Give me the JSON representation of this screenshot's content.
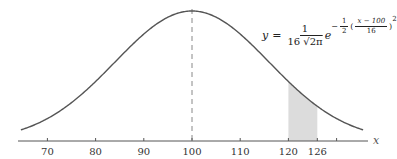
{
  "chart_data": {
    "type": "line",
    "title": "",
    "subtitle": "",
    "xlabel": "x",
    "ylabel": "",
    "distribution": "normal",
    "mean": 100,
    "std_dev": 16,
    "formula_text": "y = 1/(16√(2π)) e^(-1/2((x - 100)/16)^2)",
    "x_ticks": [
      70,
      80,
      90,
      100,
      110,
      120,
      126,
      130
    ],
    "x_tick_labels": [
      "70",
      "80",
      "90",
      "100",
      "110",
      "120",
      "126",
      ""
    ],
    "xlim": [
      64,
      136
    ],
    "grid": false,
    "legend": "none",
    "annotations": [
      {
        "type": "vertical-dashed-line",
        "x": 100,
        "label": "mean"
      },
      {
        "type": "shaded-region",
        "x_start": 120,
        "x_end": 126
      }
    ],
    "series": [
      {
        "name": "normal density",
        "x_range": [
          64.5,
          135.5
        ],
        "peak_x": 100
      }
    ]
  },
  "formula": {
    "y": "y",
    "equals": "=",
    "coef_num": "1",
    "coef_den": "16",
    "sqrt_content": "2π",
    "e": "e",
    "exp_sign": "−",
    "half_num": "1",
    "half_den": "2",
    "open": "(",
    "inner_num": "x − 100",
    "inner_den": "16",
    "close": ")",
    "power": "2"
  },
  "axis": {
    "variable": "x",
    "labels": [
      "70",
      "80",
      "90",
      "100",
      "110",
      "120",
      "126"
    ]
  },
  "colors": {
    "curve": "#555555",
    "axis": "#555555",
    "shade": "#dcdcdc",
    "dashed": "#888888"
  }
}
